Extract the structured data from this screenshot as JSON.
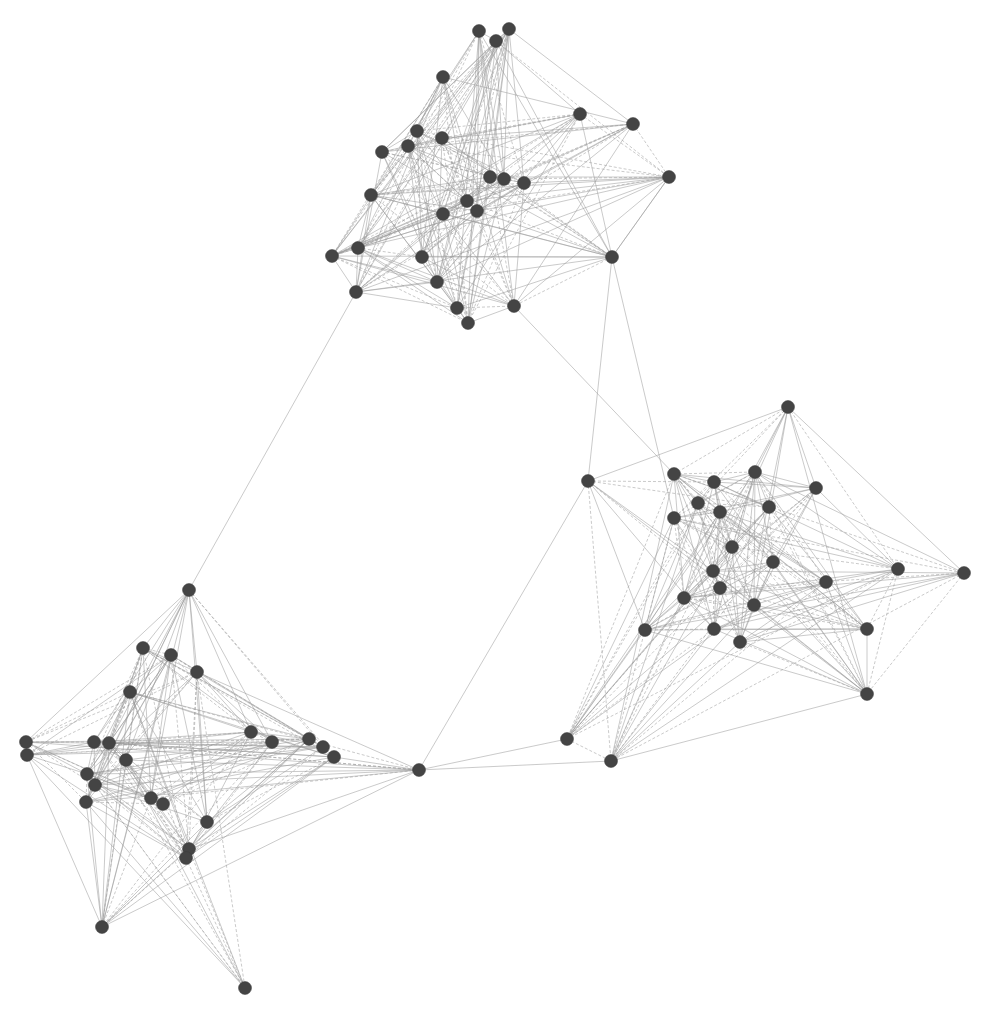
{
  "graph": {
    "type": "network",
    "node_color": "#444444",
    "edge_color": "#9a9a9a",
    "node_radius": 6.5,
    "clusters": [
      {
        "name": "top",
        "nodes": [
          [
            479,
            31
          ],
          [
            509,
            29
          ],
          [
            496,
            41
          ],
          [
            443,
            77
          ],
          [
            580,
            114
          ],
          [
            633,
            124
          ],
          [
            417,
            131
          ],
          [
            408,
            146
          ],
          [
            442,
            138
          ],
          [
            382,
            152
          ],
          [
            490,
            177
          ],
          [
            504,
            179
          ],
          [
            524,
            183
          ],
          [
            669,
            177
          ],
          [
            371,
            195
          ],
          [
            467,
            201
          ],
          [
            477,
            211
          ],
          [
            443,
            214
          ],
          [
            358,
            248
          ],
          [
            332,
            256
          ],
          [
            422,
            257
          ],
          [
            612,
            257
          ],
          [
            437,
            282
          ],
          [
            356,
            292
          ],
          [
            457,
            308
          ],
          [
            514,
            306
          ],
          [
            468,
            323
          ]
        ]
      },
      {
        "name": "right",
        "nodes": [
          [
            788,
            407
          ],
          [
            588,
            481
          ],
          [
            674,
            474
          ],
          [
            714,
            482
          ],
          [
            755,
            472
          ],
          [
            816,
            488
          ],
          [
            698,
            503
          ],
          [
            720,
            512
          ],
          [
            769,
            507
          ],
          [
            674,
            518
          ],
          [
            732,
            547
          ],
          [
            773,
            562
          ],
          [
            713,
            571
          ],
          [
            898,
            569
          ],
          [
            964,
            573
          ],
          [
            826,
            582
          ],
          [
            720,
            588
          ],
          [
            684,
            598
          ],
          [
            754,
            605
          ],
          [
            645,
            630
          ],
          [
            714,
            629
          ],
          [
            867,
            629
          ],
          [
            740,
            642
          ],
          [
            867,
            694
          ],
          [
            567,
            739
          ],
          [
            611,
            761
          ]
        ]
      },
      {
        "name": "bottom-left",
        "nodes": [
          [
            189,
            590
          ],
          [
            143,
            648
          ],
          [
            171,
            655
          ],
          [
            197,
            672
          ],
          [
            130,
            692
          ],
          [
            251,
            732
          ],
          [
            272,
            742
          ],
          [
            309,
            739
          ],
          [
            323,
            747
          ],
          [
            334,
            757
          ],
          [
            26,
            742
          ],
          [
            27,
            755
          ],
          [
            94,
            742
          ],
          [
            109,
            743
          ],
          [
            126,
            760
          ],
          [
            87,
            774
          ],
          [
            95,
            785
          ],
          [
            86,
            802
          ],
          [
            151,
            798
          ],
          [
            163,
            804
          ],
          [
            207,
            822
          ],
          [
            189,
            849
          ],
          [
            186,
            858
          ],
          [
            102,
            927
          ],
          [
            419,
            770
          ],
          [
            245,
            988
          ]
        ]
      }
    ],
    "bridge_edges": [
      [
        [
          189,
          590
        ],
        [
          356,
          292
        ]
      ],
      [
        [
          612,
          257
        ],
        [
          588,
          481
        ]
      ],
      [
        [
          669,
          177
        ],
        [
          612,
          257
        ]
      ],
      [
        [
          514,
          306
        ],
        [
          674,
          474
        ]
      ],
      [
        [
          419,
          770
        ],
        [
          588,
          481
        ]
      ],
      [
        [
          419,
          770
        ],
        [
          611,
          761
        ]
      ],
      [
        [
          419,
          770
        ],
        [
          567,
          739
        ]
      ],
      [
        [
          612,
          257
        ],
        [
          674,
          518
        ]
      ]
    ]
  }
}
